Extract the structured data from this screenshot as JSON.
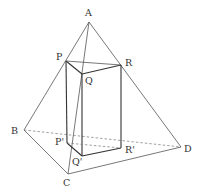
{
  "diagram": {
    "type": "geometry",
    "colors": {
      "background": "#ffffff",
      "line": "#555555",
      "text": "#333333"
    },
    "points": {
      "A": {
        "label": "A",
        "x": 89,
        "y": 22,
        "lx": 85,
        "ly": 16
      },
      "B": {
        "label": "B",
        "x": 24,
        "y": 130,
        "lx": 11,
        "ly": 134
      },
      "C": {
        "label": "C",
        "x": 68,
        "y": 174,
        "lx": 63,
        "ly": 186
      },
      "D": {
        "label": "D",
        "x": 181,
        "y": 147,
        "lx": 184,
        "ly": 152
      },
      "P": {
        "label": "P",
        "x": 66,
        "y": 61,
        "lx": 56,
        "ly": 60
      },
      "Q": {
        "label": "Q",
        "x": 82,
        "y": 74,
        "lx": 85,
        "ly": 84
      },
      "R": {
        "label": "R",
        "x": 121,
        "y": 65,
        "lx": 125,
        "ly": 66
      },
      "P2": {
        "label": "P'",
        "x": 67,
        "y": 143,
        "lx": 55,
        "ly": 145
      },
      "Q2": {
        "label": "Q'",
        "x": 82,
        "y": 156,
        "lx": 72,
        "ly": 165
      },
      "R2": {
        "label": "R'",
        "x": 121,
        "y": 148,
        "lx": 125,
        "ly": 153
      }
    },
    "labels": [
      "A",
      "B",
      "C",
      "D",
      "P",
      "Q",
      "R",
      "P'",
      "Q'",
      "R'"
    ]
  }
}
